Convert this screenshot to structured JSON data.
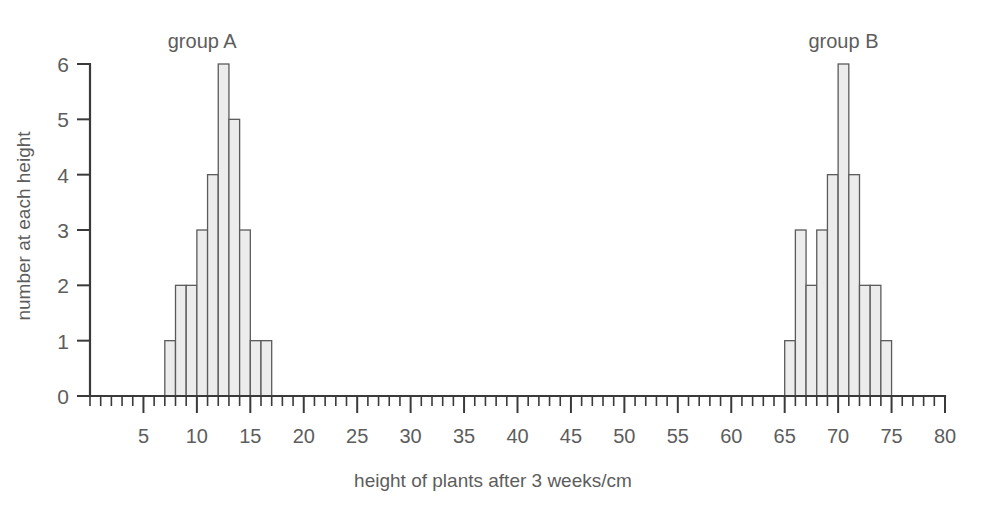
{
  "chart_data": {
    "type": "bar",
    "title": "",
    "xlabel": "height of plants after 3 weeks/cm",
    "ylabel": "number at each height",
    "xlim": [
      0,
      80
    ],
    "ylim": [
      0,
      6
    ],
    "grid": false,
    "bin_width": 1,
    "x_major_ticks": [
      5,
      10,
      15,
      20,
      25,
      30,
      35,
      40,
      45,
      50,
      55,
      60,
      65,
      70,
      75,
      80
    ],
    "x_tick_labels": [
      "5",
      "10",
      "15",
      "20",
      "25",
      "30",
      "35",
      "40",
      "45",
      "50",
      "55",
      "60",
      "65",
      "70",
      "75",
      "80"
    ],
    "x_minor_tick_step": 1,
    "y_ticks": [
      0,
      1,
      2,
      3,
      4,
      5,
      6
    ],
    "y_tick_labels": [
      "0",
      "1",
      "2",
      "3",
      "4",
      "5",
      "6"
    ],
    "legend_position": "above-bars",
    "bar_fill_color": "#ececec",
    "bar_edge_color": "#5b5b5b",
    "axis_color": "#3a3a3a",
    "text_color": "#5d5d5d",
    "series": [
      {
        "name": "group A",
        "label_x": 10.5,
        "bin_starts": [
          7,
          8,
          9,
          10,
          11,
          12,
          13,
          14,
          15,
          16
        ],
        "values": [
          1,
          2,
          2,
          3,
          4,
          6,
          5,
          3,
          1,
          1
        ]
      },
      {
        "name": "group B",
        "label_x": 70.5,
        "bin_starts": [
          65,
          66,
          67,
          68,
          69,
          70,
          71,
          72,
          73,
          74
        ],
        "values": [
          1,
          3,
          2,
          3,
          4,
          6,
          4,
          2,
          2,
          1
        ]
      }
    ]
  }
}
